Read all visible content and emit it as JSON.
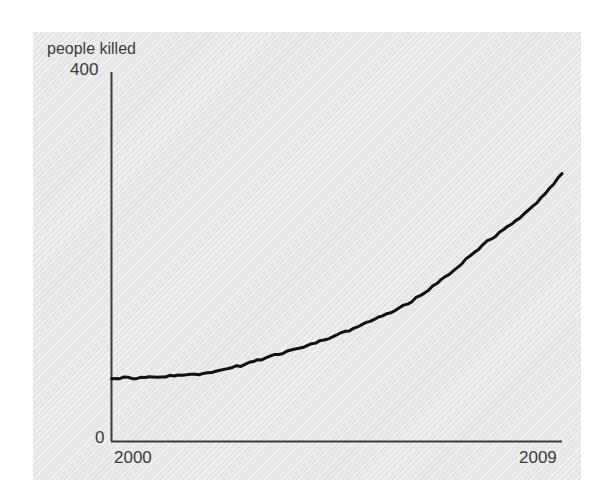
{
  "figure": {
    "background_color": "#ffffff",
    "panel_color": "#e6e6e6",
    "axis_color": "#3b3b3b",
    "line_color": "#111111"
  },
  "axes": {
    "ylabel": "people killed",
    "ytick_max": "400",
    "ytick_min": "0",
    "xtick_start": "2000",
    "xtick_end": "2009"
  },
  "chart_data": {
    "type": "line",
    "title": "",
    "subtitle": "",
    "xlabel": "",
    "ylabel": "people killed",
    "xlim": [
      2000,
      2009
    ],
    "ylim": [
      0,
      400
    ],
    "xticks": [
      2000,
      2009
    ],
    "xticklabels": [
      "2000",
      "2009"
    ],
    "yticks": [
      0,
      400
    ],
    "yticklabels": [
      "0",
      "400"
    ],
    "grid": false,
    "legend": false,
    "legend_position": "none",
    "annotations": [],
    "series": [
      {
        "name": "people killed",
        "color": "#111111",
        "line_width": 3,
        "x": [
          2000.0,
          2000.25,
          2000.5,
          2000.75,
          2001.0,
          2001.25,
          2001.5,
          2001.75,
          2002.0,
          2002.25,
          2002.5,
          2002.75,
          2003.0,
          2003.25,
          2003.5,
          2003.75,
          2004.0,
          2004.25,
          2004.5,
          2004.75,
          2005.0,
          2005.25,
          2005.5,
          2005.75,
          2006.0,
          2006.25,
          2006.5,
          2006.75,
          2007.0,
          2007.25,
          2007.5,
          2007.75,
          2008.0,
          2008.25,
          2008.5,
          2008.75,
          2009.0
        ],
        "values": [
          69,
          69,
          69,
          70,
          70,
          71,
          72,
          73,
          75,
          78,
          81,
          85,
          89,
          93,
          97,
          101,
          105,
          110,
          115,
          120,
          126,
          132,
          138,
          145,
          152,
          161,
          171,
          182,
          193,
          205,
          216,
          226,
          236,
          247,
          259,
          274,
          290
        ]
      }
    ]
  }
}
